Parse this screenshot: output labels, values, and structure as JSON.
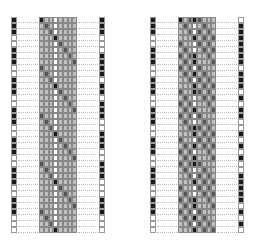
{
  "colors": {
    "black": "#1a1a1a",
    "dark": "#555555",
    "light": "#c0c0c0",
    "white": "#ffffff"
  },
  "rows": 36,
  "panels": [
    {
      "name": "left-panel",
      "x": 0,
      "left_strip": "BBBWWBBBWWBBBWWBBBWWBBBWWBBBWWBBBWWW",
      "right_strip": "BBBWWWBBBBWBBWBBBWWBBBWWBBBWWWBBBWWW",
      "matrix_rule": "diag-single"
    },
    {
      "name": "right-panel",
      "x": 139,
      "left_strip": "BBBWWBBBWWBBBWWBBBWWBBBWWBBBWWBBBWWW",
      "right_strip": "WBBBBBBBWBBBWBWBBWWBWBWBWWBBBBBWBWBW",
      "matrix_rule": "diag-double"
    }
  ]
}
